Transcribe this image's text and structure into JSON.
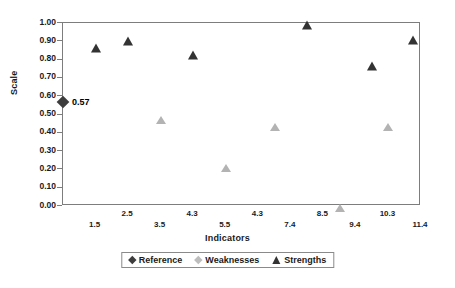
{
  "chart_data": {
    "type": "scatter",
    "title": "",
    "xlabel": "Indicators",
    "ylabel": "Scale",
    "ylim": [
      0.0,
      1.0
    ],
    "ytick_step": 0.1,
    "grid": false,
    "legend_position": "bottom",
    "ytick_labels": [
      "1.00",
      "0.90",
      "0.80",
      "0.70",
      "0.60",
      "0.50",
      "0.40",
      "0.30",
      "0.20",
      "0.10",
      "0.00"
    ],
    "ytick_values": [
      1.0,
      0.9,
      0.8,
      0.7,
      0.6,
      0.5,
      0.4,
      0.3,
      0.2,
      0.1,
      0.0
    ],
    "categories": [
      "1.5",
      "2.5",
      "3.5",
      "4.3",
      "4.3",
      "5.5",
      "7.4",
      "8.5",
      "9.4",
      "10.3",
      "11.4"
    ],
    "series": [
      {
        "name": "Reference",
        "marker": "diamond",
        "color": "#3d3d3d",
        "points": [
          {
            "category": "",
            "x_frac": 0.0,
            "value": 0.57,
            "label": "0.57"
          }
        ]
      },
      {
        "name": "Weaknesses",
        "marker": "triangle",
        "color": "#b3b3b3",
        "points": [
          {
            "category": "3.5",
            "x_frac": 0.2727,
            "value": 0.48,
            "label": ""
          },
          {
            "category": "5.5",
            "x_frac": 0.4545,
            "value": 0.22,
            "label": ""
          },
          {
            "category": "4.3",
            "x_frac": 0.5909,
            "value": 0.445,
            "label": ""
          },
          {
            "category": "8.5",
            "x_frac": 0.7727,
            "value": 0.0,
            "label": ""
          },
          {
            "category": "10.3",
            "x_frac": 0.9091,
            "value": 0.44,
            "label": ""
          }
        ]
      },
      {
        "name": "Strengths",
        "marker": "triangle",
        "color": "#333333",
        "points": [
          {
            "category": "1.5",
            "x_frac": 0.0909,
            "value": 0.875,
            "label": ""
          },
          {
            "category": "2.5",
            "x_frac": 0.1818,
            "value": 0.915,
            "label": ""
          },
          {
            "category": "4.3",
            "x_frac": 0.3636,
            "value": 0.835,
            "label": ""
          },
          {
            "category": "7.4",
            "x_frac": 0.6818,
            "value": 1.0,
            "label": ""
          },
          {
            "category": "9.4",
            "x_frac": 0.8636,
            "value": 0.775,
            "label": ""
          },
          {
            "category": "11.4",
            "x_frac": 0.9773,
            "value": 0.92,
            "label": ""
          }
        ]
      }
    ]
  },
  "axes": {
    "y_title": "Scale",
    "x_title": "Indicators",
    "x_ticks": [
      {
        "label": "1.5",
        "x_frac": 0.0909,
        "row": "b"
      },
      {
        "label": "2.5",
        "x_frac": 0.1818,
        "row": "a"
      },
      {
        "label": "3.5",
        "x_frac": 0.2727,
        "row": "b"
      },
      {
        "label": "4.3",
        "x_frac": 0.3636,
        "row": "a"
      },
      {
        "label": "5.5",
        "x_frac": 0.4545,
        "row": "b"
      },
      {
        "label": "4.3",
        "x_frac": 0.5455,
        "row": "a"
      },
      {
        "label": "7.4",
        "x_frac": 0.6364,
        "row": "b"
      },
      {
        "label": "8.5",
        "x_frac": 0.7273,
        "row": "a"
      },
      {
        "label": "9.4",
        "x_frac": 0.8182,
        "row": "b"
      },
      {
        "label": "10.3",
        "x_frac": 0.9091,
        "row": "a"
      },
      {
        "label": "11.4",
        "x_frac": 1.0,
        "row": "b"
      }
    ]
  },
  "legend": {
    "items": [
      {
        "label": "Reference",
        "swatch": "diamond-dark"
      },
      {
        "label": "Weaknesses",
        "swatch": "diamond-light"
      },
      {
        "label": "Strengths",
        "swatch": "triangle-dark"
      }
    ]
  },
  "top_caption": {
    "text": ""
  }
}
